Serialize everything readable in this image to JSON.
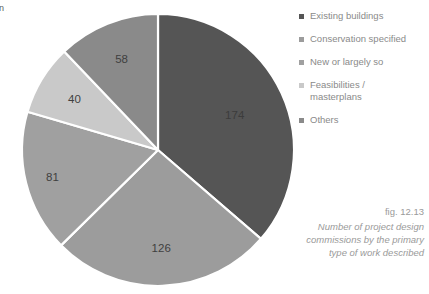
{
  "page": {
    "edge_fragment": "An\n1\n-"
  },
  "chart_data": {
    "type": "pie",
    "title": "",
    "categories": [
      "Existing buildings",
      "Conservation specified",
      "New or largely so",
      "Feasibilities / masterplans",
      "Others"
    ],
    "values": [
      174,
      126,
      81,
      40,
      58
    ],
    "total": 479,
    "colors": [
      "#555555",
      "#9c9c9c",
      "#a0a0a0",
      "#c9c9c9",
      "#8a8a8a"
    ],
    "data_labels": [
      "174",
      "126",
      "81",
      "40",
      "58"
    ],
    "start_angle_deg": 0,
    "direction": "clockwise",
    "legend_position": "right",
    "grid": false,
    "xlabel": "",
    "ylabel": ""
  },
  "legend": {
    "items": [
      {
        "label": "Existing buildings",
        "color": "#555555"
      },
      {
        "label": "Conservation specified",
        "color": "#9c9c9c"
      },
      {
        "label": "New or largely so",
        "color": "#a0a0a0"
      },
      {
        "label": "Feasibilities /\nmasterplans",
        "color": "#c9c9c9"
      },
      {
        "label": "Others",
        "color": "#8a8a8a"
      }
    ]
  },
  "caption": {
    "figure_number": "fig. 12.13",
    "text": "Number of project design commissions by the primary type of work described"
  }
}
